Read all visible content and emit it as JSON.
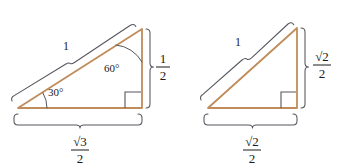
{
  "figure": {
    "background_color": "#ffffff",
    "triangle_stroke_color": "#c08c5a",
    "annotation_stroke_color": "#4a4a55",
    "text_color": "#1a1a1a"
  },
  "triangles": [
    {
      "id": "triangle-30-60-90",
      "name": "30-60-90 triangle",
      "vertices": {
        "left": [
          18,
          108
        ],
        "right": [
          142,
          108
        ],
        "apex": [
          142,
          29
        ]
      },
      "hypotenuse_label": "1",
      "base_label_numerator": "√3",
      "base_label_denominator": "2",
      "height_label_numerator": "1",
      "height_label_denominator": "2",
      "angles": [
        {
          "name": "angle-30",
          "label": "30°",
          "vertex": "left"
        },
        {
          "name": "angle-60",
          "label": "60°",
          "vertex": "apex"
        }
      ],
      "right_angle_at": "right"
    },
    {
      "id": "triangle-45-45-90",
      "name": "45-45-90 triangle",
      "vertices": {
        "left": [
          208,
          108
        ],
        "right": [
          297,
          108
        ],
        "apex": [
          297,
          28
        ]
      },
      "hypotenuse_label": "1",
      "base_label_numerator": "√2",
      "base_label_denominator": "2",
      "height_label_numerator": "√2",
      "height_label_denominator": "2",
      "angles": [],
      "right_angle_at": "right"
    }
  ],
  "labels": {
    "left_hypotenuse": "1",
    "left_angle_small": "30°",
    "left_angle_large": "60°",
    "left_base_num": "√3",
    "left_base_den": "2",
    "left_height_num": "1",
    "left_height_den": "2",
    "right_hypotenuse": "1",
    "right_base_num": "√2",
    "right_base_den": "2",
    "right_height_num": "√2",
    "right_height_den": "2"
  }
}
